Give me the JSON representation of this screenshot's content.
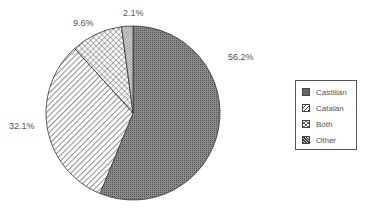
{
  "chart_data": {
    "type": "pie",
    "title": "",
    "categories": [
      "Castilian",
      "Catalan",
      "Both",
      "Other"
    ],
    "values": [
      56.2,
      32.1,
      9.6,
      2.1
    ],
    "labels": [
      "56.2%",
      "32.1%",
      "9.6%",
      "2.1%"
    ],
    "legend": {
      "position": "right",
      "entries": [
        "Castilian",
        "Catalan",
        "Both",
        "Other"
      ]
    },
    "fills": [
      "dense-dots-dark",
      "diagonal-lines",
      "crosshatch",
      "dense-diagonal"
    ],
    "colors": [
      "#777777",
      "#ffffff",
      "#ffffff",
      "#888888"
    ],
    "start_angle_deg": 0,
    "direction": "clockwise"
  }
}
